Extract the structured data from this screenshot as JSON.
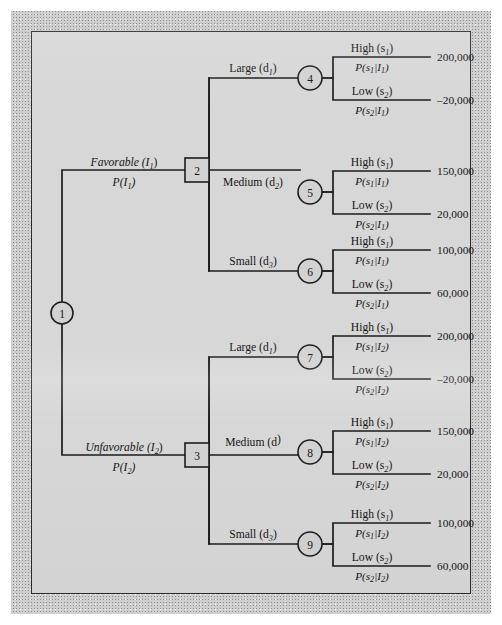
{
  "figure": {
    "type": "decision-tree",
    "background_color": "#d7d7d7",
    "line_color": "#1d1d1d",
    "node_fill": "#d2d2d2"
  },
  "nodes": [
    {
      "id": "1",
      "label": "1",
      "shape": "circle",
      "role": "chance-node-information",
      "x": 62,
      "y": 313
    },
    {
      "id": "2",
      "label": "2",
      "shape": "square",
      "role": "decision-node-favorable",
      "x": 197,
      "y": 170
    },
    {
      "id": "3",
      "label": "3",
      "shape": "square",
      "role": "decision-node-unfavorable",
      "x": 197,
      "y": 455
    },
    {
      "id": "4",
      "label": "4",
      "shape": "circle",
      "role": "chance-node-large-fav",
      "x": 310,
      "y": 78
    },
    {
      "id": "5",
      "label": "5",
      "shape": "circle",
      "role": "chance-node-medium-fav",
      "x": 310,
      "y": 192
    },
    {
      "id": "6",
      "label": "6",
      "shape": "circle",
      "role": "chance-node-small-fav",
      "x": 310,
      "y": 271
    },
    {
      "id": "7",
      "label": "7",
      "shape": "circle",
      "role": "chance-node-large-unfav",
      "x": 310,
      "y": 357
    },
    {
      "id": "8",
      "label": "8",
      "shape": "circle",
      "role": "chance-node-medium-unfav",
      "x": 310,
      "y": 452
    },
    {
      "id": "9",
      "label": "9",
      "shape": "circle",
      "role": "chance-node-small-unfav",
      "x": 310,
      "y": 544
    }
  ],
  "information_branches": [
    {
      "name": "favorable",
      "label": "Favorable (I",
      "label_sub": "1",
      "label_tail": ")",
      "probability": "P(I",
      "probability_sub": "1",
      "probability_tail": ")",
      "to_node": "2"
    },
    {
      "name": "unfavorable",
      "label": "Unfavorable (I",
      "label_sub": "2",
      "label_tail": ")",
      "probability": "P(I",
      "probability_sub": "2",
      "probability_tail": ")",
      "to_node": "3"
    }
  ],
  "decision_branches": [
    {
      "name": "large-favorable",
      "label": "Large (d",
      "sub": "1",
      "tail": ")",
      "from": "2",
      "to": "4"
    },
    {
      "name": "medium-favorable",
      "label": "Medium (d",
      "sub": "2",
      "tail": ")",
      "from": "2",
      "to": "5"
    },
    {
      "name": "small-favorable",
      "label": "Small (d",
      "sub": "3",
      "tail": ")",
      "from": "2",
      "to": "6"
    },
    {
      "name": "large-unfavorable",
      "label": "Large (d",
      "sub": "1",
      "tail": ")",
      "from": "3",
      "to": "7"
    },
    {
      "name": "medium-unfavorable",
      "label": "Medium (d",
      "sub": "",
      "tail": ")",
      "from": "3",
      "to": "8"
    },
    {
      "name": "small-unfavorable",
      "label": "Small (d",
      "sub": "3",
      "tail": ")",
      "from": "3",
      "to": "9"
    }
  ],
  "outcomes": [
    {
      "node": "4",
      "state": "High (s",
      "state_sub": "1",
      "state_tail": ")",
      "cond": "P(s",
      "cond_sub1": "1",
      "cond_mid": "|I",
      "cond_sub2": "1",
      "cond_tail": ")",
      "payoff": "200,000"
    },
    {
      "node": "4",
      "state": "Low (s",
      "state_sub": "2",
      "state_tail": ")",
      "cond": "P(s",
      "cond_sub1": "2",
      "cond_mid": "|I",
      "cond_sub2": "1",
      "cond_tail": ")",
      "payoff": "–20,000"
    },
    {
      "node": "5",
      "state": "High (s",
      "state_sub": "1",
      "state_tail": ")",
      "cond": "P(s",
      "cond_sub1": "1",
      "cond_mid": "|I",
      "cond_sub2": "1",
      "cond_tail": ")",
      "payoff": "150,000"
    },
    {
      "node": "5",
      "state": "Low (s",
      "state_sub": "2",
      "state_tail": ")",
      "cond": "P(s",
      "cond_sub1": "2",
      "cond_mid": "|I",
      "cond_sub2": "1",
      "cond_tail": ")",
      "payoff": "20,000"
    },
    {
      "node": "6",
      "state": "High (s",
      "state_sub": "1",
      "state_tail": ")",
      "cond": "P(s",
      "cond_sub1": "1",
      "cond_mid": "|I",
      "cond_sub2": "1",
      "cond_tail": ")",
      "payoff": "100,000"
    },
    {
      "node": "6",
      "state": "Low (s",
      "state_sub": "2",
      "state_tail": ")",
      "cond": "P(s",
      "cond_sub1": "2",
      "cond_mid": "|I",
      "cond_sub2": "1",
      "cond_tail": ")",
      "payoff": "60,000"
    },
    {
      "node": "7",
      "state": "High (s",
      "state_sub": "1",
      "state_tail": ")",
      "cond": "P(s",
      "cond_sub1": "1",
      "cond_mid": "|I",
      "cond_sub2": "2",
      "cond_tail": ")",
      "payoff": "200,000"
    },
    {
      "node": "7",
      "state": "Low (s",
      "state_sub": "2",
      "state_tail": ")",
      "cond": "P(s",
      "cond_sub1": "2",
      "cond_mid": "|I",
      "cond_sub2": "2",
      "cond_tail": ")",
      "payoff": "–20,000"
    },
    {
      "node": "8",
      "state": "High (s",
      "state_sub": "1",
      "state_tail": ")",
      "cond": "P(s",
      "cond_sub1": "1",
      "cond_mid": "|I",
      "cond_sub2": "2",
      "cond_tail": ")",
      "payoff": "150,000"
    },
    {
      "node": "8",
      "state": "Low (s",
      "state_sub": "2",
      "state_tail": ")",
      "cond": "P(s",
      "cond_sub1": "2",
      "cond_mid": "|I",
      "cond_sub2": "2",
      "cond_tail": ")",
      "payoff": "20,000"
    },
    {
      "node": "9",
      "state": "High (s",
      "state_sub": "1",
      "state_tail": ")",
      "cond": "P(s",
      "cond_sub1": "1",
      "cond_mid": "|I",
      "cond_sub2": "2",
      "cond_tail": ")",
      "payoff": "100,000"
    },
    {
      "node": "9",
      "state": "Low (s",
      "state_sub": "2",
      "state_tail": ")",
      "cond": "P(s",
      "cond_sub1": "2",
      "cond_mid": "|I",
      "cond_sub2": "2",
      "cond_tail": ")",
      "payoff": "60,000"
    }
  ]
}
